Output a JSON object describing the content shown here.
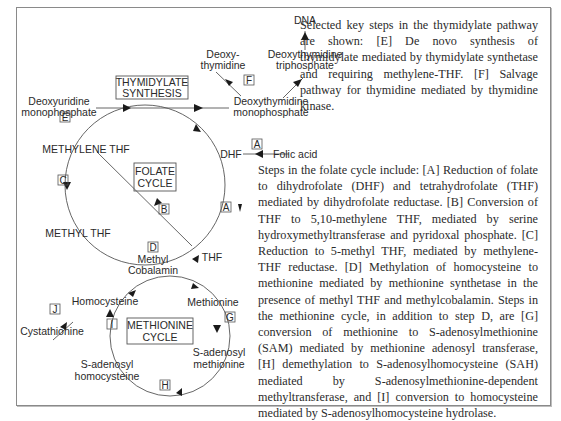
{
  "diagram": {
    "title_boxes": {
      "thymidylate": [
        "THYMIDYLATE",
        "SYNTHESIS"
      ],
      "folate": [
        "FOLATE",
        "CYCLE"
      ],
      "methionine": [
        "METHIONINE",
        "CYCLE"
      ]
    },
    "nodes": {
      "dna": "DNA",
      "deoxythymidine": [
        "Deoxy-",
        "thymidine"
      ],
      "dttp": [
        "Deoxythymidine",
        "triphosphate"
      ],
      "dump": [
        "Deoxyuridine",
        "monophosphate"
      ],
      "dtmp": [
        "Deoxythymidine",
        "monophosphate"
      ],
      "dhf": "DHF",
      "folic_acid": "Folic acid",
      "methylene_thf": "METHYLENE THF",
      "methyl_thf": "METHYL THF",
      "thf": "THF",
      "methyl_cobalamin": [
        "Methyl",
        "Cobalamin"
      ],
      "homocysteine": "Homocysteine",
      "methionine": "Methionine",
      "cystathionine": "Cystathionine",
      "sam": [
        "S-adenosyl",
        "methionine"
      ],
      "sah": [
        "S-adenosyl",
        "homocysteine"
      ]
    },
    "step_labels": {
      "A1": "A",
      "A2": "A",
      "B": "B",
      "C": "C",
      "D": "D",
      "E": "E",
      "F": "F",
      "G": "G",
      "H": "H",
      "I": "I",
      "J": "J"
    }
  },
  "caption": {
    "thymidylate_pathway": "Selected key steps in the thymidylate pathway are shown: [E] De novo synthesis of thymidylate mediated by thymidylate synthetase and requiring methylene-THF. [F] Salvage pathway for thymidine mediated by thymidine kinase.",
    "folate_methionine": "Steps in the folate cycle include: [A] Reduction of folate to dihydrofolate (DHF) and tetrahydrofolate (THF) mediated by dihydrofolate reductase. [B] Conversion of THF to 5,10-methylene THF, mediated by serine hydroxymethyltransferase and pyridoxal phosphate. [C] Reduction to 5-methyl THF, mediated by methylene-THF reductase. [D] Methylation of homocysteine to methionine mediated by methionine synthetase in the presence of methyl THF and methylcobalamin. Steps in the methionine cycle, in addition to step D, are [G] conversion of methionine to S-adenosylmethionine (SAM) mediated by methionine adenosyl transferase, [H] demethylation to S-adenosylhomocysteine (SAH) mediated by S-adenosylmethionine-dependent methyltransferase, and [I] conversion to homocysteine mediated by S-adenosylhomocysteine hydrolase."
  },
  "colors": {
    "ink": "#2a2a2a",
    "line": "#555555",
    "frame": "#8a8a8a"
  }
}
